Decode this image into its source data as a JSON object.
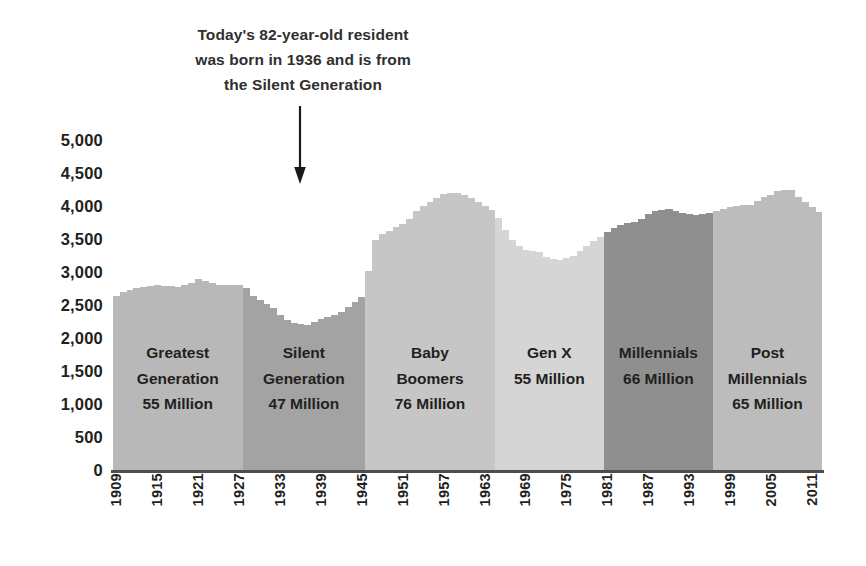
{
  "annotation": {
    "line1": "Today's 82-year-old resident",
    "line2": "was born in 1936 and is from",
    "line3": "the Silent Generation",
    "arrow_target_year": 1936
  },
  "chart_data": {
    "type": "bar",
    "title": "",
    "subtitle": "",
    "xlabel": "",
    "ylabel": "",
    "ylim": [
      0,
      5000
    ],
    "ytick_labels": [
      "0",
      "500",
      "1,000",
      "1,500",
      "2,000",
      "2,500",
      "3,000",
      "3,500",
      "4,000",
      "4,500",
      "5,000"
    ],
    "ytick_values": [
      0,
      500,
      1000,
      1500,
      2000,
      2500,
      3000,
      3500,
      4000,
      4500,
      5000
    ],
    "xtick_labels": [
      "1909",
      "1915",
      "1921",
      "1927",
      "1933",
      "1939",
      "1945",
      "1951",
      "1957",
      "1963",
      "1969",
      "1975",
      "1981",
      "1987",
      "1993",
      "1999",
      "2005",
      "2011"
    ],
    "xtick_values": [
      1909,
      1915,
      1921,
      1927,
      1933,
      1939,
      1945,
      1951,
      1957,
      1963,
      1969,
      1975,
      1981,
      1987,
      1993,
      1999,
      2005,
      2011
    ],
    "grid": false,
    "legend": "none",
    "x": [
      1909,
      1910,
      1911,
      1912,
      1913,
      1914,
      1915,
      1916,
      1917,
      1918,
      1919,
      1920,
      1921,
      1922,
      1923,
      1924,
      1925,
      1926,
      1927,
      1928,
      1929,
      1930,
      1931,
      1932,
      1933,
      1934,
      1935,
      1936,
      1937,
      1938,
      1939,
      1940,
      1941,
      1942,
      1943,
      1944,
      1945,
      1946,
      1947,
      1948,
      1949,
      1950,
      1951,
      1952,
      1953,
      1954,
      1955,
      1956,
      1957,
      1958,
      1959,
      1960,
      1961,
      1962,
      1963,
      1964,
      1965,
      1966,
      1967,
      1968,
      1969,
      1970,
      1971,
      1972,
      1973,
      1974,
      1975,
      1976,
      1977,
      1978,
      1979,
      1980,
      1981,
      1982,
      1983,
      1984,
      1985,
      1986,
      1987,
      1988,
      1989,
      1990,
      1991,
      1992,
      1993,
      1994,
      1995,
      1996,
      1997,
      1998,
      1999,
      2000,
      2001,
      2002,
      2003,
      2004,
      2005,
      2006,
      2007,
      2008,
      2009,
      2010,
      2011,
      2012
    ],
    "values": [
      2630,
      2700,
      2730,
      2760,
      2780,
      2790,
      2800,
      2790,
      2790,
      2780,
      2800,
      2840,
      2900,
      2860,
      2830,
      2810,
      2800,
      2800,
      2800,
      2760,
      2640,
      2580,
      2520,
      2450,
      2350,
      2280,
      2230,
      2210,
      2200,
      2240,
      2290,
      2320,
      2350,
      2400,
      2470,
      2550,
      2620,
      3020,
      3480,
      3570,
      3620,
      3680,
      3720,
      3810,
      3930,
      4000,
      4060,
      4120,
      4180,
      4200,
      4200,
      4170,
      4120,
      4060,
      4000,
      3940,
      3820,
      3640,
      3490,
      3400,
      3340,
      3320,
      3300,
      3230,
      3200,
      3180,
      3210,
      3250,
      3320,
      3400,
      3470,
      3530,
      3600,
      3660,
      3710,
      3740,
      3760,
      3810,
      3880,
      3920,
      3940,
      3960,
      3920,
      3900,
      3880,
      3870,
      3880,
      3890,
      3920,
      3960,
      3980,
      4000,
      4010,
      4020,
      4080,
      4130,
      4170,
      4220,
      4250,
      4240,
      4130,
      4060,
      3980,
      3910
    ],
    "value_units": "thousands of births",
    "bands": [
      {
        "id": "greatest",
        "label_line1": "Greatest",
        "label_line2": "Generation",
        "label_line3": "55 Million",
        "population": "55 Million",
        "start_year": 1909,
        "end_year": 1927,
        "color": "#b8b8b8",
        "label_top": 200,
        "lines": 3
      },
      {
        "id": "silent",
        "label_line1": "Silent",
        "label_line2": "Generation",
        "label_line3": "47 Million",
        "population": "47 Million",
        "start_year": 1928,
        "end_year": 1945,
        "color": "#a3a3a3",
        "label_top": 200,
        "lines": 3
      },
      {
        "id": "baby-boomers",
        "label_line1": "Baby",
        "label_line2": "Boomers",
        "label_line3": "76 Million",
        "population": "76 Million",
        "start_year": 1946,
        "end_year": 1964,
        "color": "#c6c6c6",
        "label_top": 200,
        "lines": 3
      },
      {
        "id": "gen-x",
        "label_line1": "",
        "label_line2": "Gen X",
        "label_line3": "55 Million",
        "population": "55 Million",
        "start_year": 1965,
        "end_year": 1980,
        "color": "#d5d5d5",
        "label_top": 200,
        "lines": 2
      },
      {
        "id": "millennials",
        "label_line1": "",
        "label_line2": "Millennials",
        "label_line3": "66 Million",
        "population": "66 Million",
        "start_year": 1981,
        "end_year": 1996,
        "color": "#8f8f8f",
        "label_top": 200,
        "lines": 2
      },
      {
        "id": "post-millennials",
        "label_line1": "Post",
        "label_line2": "Millennials",
        "label_line3": "65 Million",
        "population": "65 Million",
        "start_year": 1997,
        "end_year": 2012,
        "color": "#bcbcbc",
        "label_top": 200,
        "lines": 3
      }
    ],
    "colors": {
      "axis": "#4d4d4d",
      "text": "#231f20",
      "arrow": "#1a1a1a",
      "background": "#ffffff"
    }
  }
}
